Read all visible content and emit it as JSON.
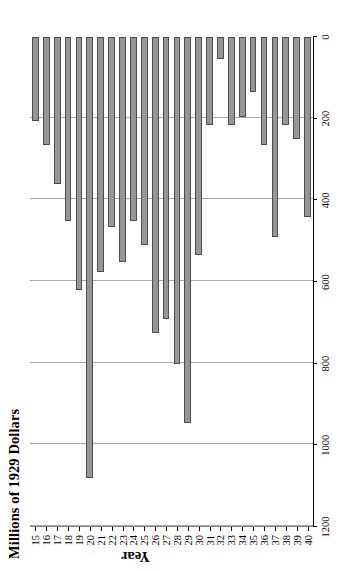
{
  "chart_data": {
    "type": "bar",
    "orientation": "vertical-rendered-rotated",
    "title": "Millions of 1929 Dollars",
    "xlabel": "Year",
    "ylabel": "Millions of 1929 Dollars",
    "ylim": [
      0,
      1200
    ],
    "ytick_labels": [
      "0",
      "200",
      "400",
      "600",
      "800",
      "1000",
      "1200"
    ],
    "ytick_values": [
      0,
      200,
      400,
      600,
      800,
      1000,
      1200
    ],
    "grid": true,
    "legend": null,
    "bar_fill_color": "#969696",
    "bar_border_color": "#4d4d4d",
    "gridline_color": "#a9a9a9",
    "axis_color": "#000000",
    "categories": [
      "15",
      "16",
      "17",
      "18",
      "19",
      "20",
      "21",
      "22",
      "23",
      "24",
      "25",
      "26",
      "27",
      "28",
      "29",
      "30",
      "31",
      "32",
      "33",
      "34",
      "35",
      "36",
      "37",
      "38",
      "39",
      "40"
    ],
    "values": [
      205,
      265,
      360,
      450,
      620,
      1080,
      575,
      465,
      550,
      450,
      510,
      725,
      690,
      800,
      945,
      535,
      215,
      55,
      215,
      195,
      135,
      265,
      490,
      215,
      250,
      440
    ]
  }
}
